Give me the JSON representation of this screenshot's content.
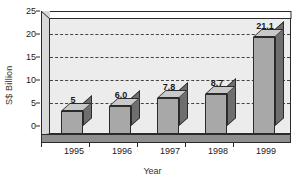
{
  "chart_data": {
    "type": "bar",
    "title": "",
    "xlabel": "Year",
    "ylabel": "S$ Billion",
    "categories": [
      "1995",
      "1996",
      "1997",
      "1998",
      "1999"
    ],
    "values": [
      5.0,
      6.0,
      7.8,
      8.7,
      21.1
    ],
    "value_labels": [
      "5",
      "6.0",
      "7.8",
      "8.7",
      "21.1"
    ],
    "ylim": [
      0,
      25
    ],
    "yticks": [
      0,
      5,
      10,
      15,
      20,
      25
    ],
    "ytick_labels": [
      "0",
      "5",
      "10",
      "15",
      "20",
      "25"
    ],
    "grid": true,
    "grid_style": "dashed-horizontal",
    "legend": "none",
    "style": "3d-bar",
    "colors": {
      "bar_front": "#a8a8a9",
      "bar_side": "#6e6e6f",
      "bar_top": "#c9c9ca",
      "plot_background": "#ececed",
      "floor": "#8f8f90",
      "axis": "#2b2b2b",
      "grid": "#444444",
      "text": "#1a1a1a"
    }
  }
}
